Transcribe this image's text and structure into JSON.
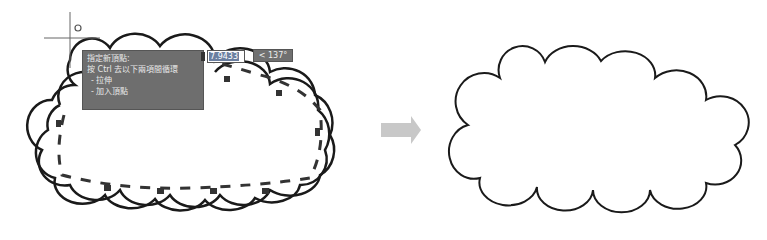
{
  "figure": {
    "left_panel": "cloud revision edit in progress",
    "right_panel": "resulting revision cloud"
  },
  "tooltip": {
    "lines": [
      "指定新頂點:",
      "按 Ctrl 去以下兩項間循環",
      "- 拉伸",
      "- 加入頂點"
    ]
  },
  "dynamic_input": {
    "length_value": "7.9433",
    "angle_value": "< 137°"
  },
  "icons": {
    "crosshair": "crosshair-cursor-icon",
    "pickbox": "osnap-circle-icon",
    "arrow": "right-arrow-icon"
  },
  "colors": {
    "tooltip_bg": "#6e6e6e",
    "input_highlight": "#6b7fa0",
    "cloud_stroke": "#1a1a1a",
    "arrow_fill": "#c8c8c8"
  }
}
